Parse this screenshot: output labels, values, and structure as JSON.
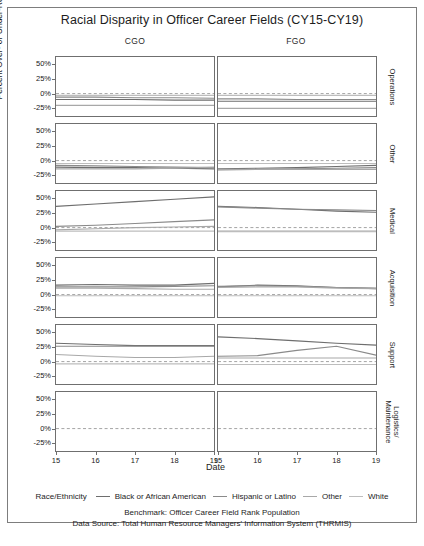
{
  "title": "Racial Disparity in Officer Career Fields (CY15-CY19)",
  "columns": [
    {
      "key": "CGO",
      "label": "CGO"
    },
    {
      "key": "FGO",
      "label": "FGO"
    }
  ],
  "rows": [
    {
      "key": "operations",
      "label": "Operations"
    },
    {
      "key": "other",
      "label": "Other"
    },
    {
      "key": "medical",
      "label": "Medical"
    },
    {
      "key": "acquisition",
      "label": "Acquisition"
    },
    {
      "key": "support",
      "label": "Support"
    },
    {
      "key": "logistics",
      "label": "Logistics/\nMaintenance"
    }
  ],
  "axes": {
    "ylabel": "Percent Over- or Under-Representation",
    "xlabel": "Date",
    "yticks": [
      "50%",
      "25%",
      "0%",
      "-25%"
    ],
    "ytick_values": [
      50,
      25,
      0,
      -25
    ],
    "xticks": [
      "15",
      "16",
      "17",
      "18",
      "19"
    ],
    "xtick_values": [
      15,
      16,
      17,
      18,
      19
    ],
    "ylim": [
      -38,
      62
    ],
    "xlim": [
      15,
      19
    ],
    "zero_line": 0,
    "grid": "none"
  },
  "legend": {
    "title": "Race/Ethnicity",
    "position": "bottom",
    "entries": [
      {
        "label": "Black or African American",
        "color": "#6e6e6e"
      },
      {
        "label": "Hispanic or Latino",
        "color": "#8a8a8a"
      },
      {
        "label": "Other",
        "color": "#a8a8a8"
      },
      {
        "label": "White",
        "color": "#bdbdbd"
      }
    ]
  },
  "captions": {
    "benchmark": "Benchmark: Officer Career Field Rank Population",
    "source": "Data Source: Total Human Resource Managers' Information System (THRMIS)"
  },
  "chart_data": {
    "type": "line",
    "title": "Racial Disparity in Officer Career Fields (CY15-CY19)",
    "xlabel": "Date",
    "ylabel": "Percent Over- or Under-Representation",
    "x": [
      15,
      16,
      17,
      18,
      19
    ],
    "xlim": [
      15,
      19
    ],
    "ylim": [
      -38,
      62
    ],
    "yticks": [
      50,
      25,
      0,
      -25
    ],
    "grid": false,
    "legend_position": "bottom",
    "facet_rows": [
      "Operations",
      "Other",
      "Medical",
      "Acquisition",
      "Support",
      "Logistics/Maintenance"
    ],
    "facet_cols": [
      "CGO",
      "FGO"
    ],
    "units": "percent",
    "reference_line": {
      "value": 0,
      "style": "dashed"
    },
    "panels": [
      {
        "row": "Operations",
        "col": "CGO",
        "series": [
          {
            "name": "Black or African American",
            "color": "#6e6e6e",
            "values": [
              -10,
              -10,
              -10,
              -11,
              -11
            ]
          },
          {
            "name": "Hispanic or Latino",
            "color": "#8a8a8a",
            "values": [
              -6,
              -6,
              -7,
              -7,
              -8
            ]
          },
          {
            "name": "Other",
            "color": "#a8a8a8",
            "values": [
              -20,
              -20,
              -20,
              -20,
              -20
            ]
          },
          {
            "name": "White",
            "color": "#bdbdbd",
            "values": [
              -3,
              -3,
              -3,
              -3,
              -3
            ]
          }
        ]
      },
      {
        "row": "Operations",
        "col": "FGO",
        "series": [
          {
            "name": "Black or African American",
            "color": "#6e6e6e",
            "values": [
              -13,
              -13,
              -13,
              -13,
              -13
            ]
          },
          {
            "name": "Hispanic or Latino",
            "color": "#8a8a8a",
            "values": [
              -9,
              -9,
              -10,
              -10,
              -10
            ]
          },
          {
            "name": "Other",
            "color": "#a8a8a8",
            "values": [
              -25,
              -25,
              -25,
              -25,
              -25
            ]
          },
          {
            "name": "White",
            "color": "#bdbdbd",
            "values": [
              -3,
              -3,
              -3,
              -3,
              -3
            ]
          }
        ]
      },
      {
        "row": "Other",
        "col": "CGO",
        "series": [
          {
            "name": "Black or African American",
            "color": "#6e6e6e",
            "values": [
              -11,
              -12,
              -12,
              -13,
              -14
            ]
          },
          {
            "name": "Hispanic or Latino",
            "color": "#8a8a8a",
            "values": [
              -8,
              -9,
              -10,
              -11,
              -12
            ]
          },
          {
            "name": "Other",
            "color": "#a8a8a8",
            "values": [
              -14,
              -14,
              -14,
              -13,
              -11
            ]
          },
          {
            "name": "White",
            "color": "#bdbdbd",
            "values": [
              -5,
              -5,
              -5,
              -5,
              -5
            ]
          }
        ]
      },
      {
        "row": "Other",
        "col": "FGO",
        "series": [
          {
            "name": "Black or African American",
            "color": "#6e6e6e",
            "values": [
              -14,
              -13,
              -12,
              -10,
              -8
            ]
          },
          {
            "name": "Hispanic or Latino",
            "color": "#8a8a8a",
            "values": [
              -16,
              -15,
              -14,
              -13,
              -12
            ]
          },
          {
            "name": "Other",
            "color": "#a8a8a8",
            "values": [
              -15,
              -15,
              -15,
              -15,
              -15
            ]
          },
          {
            "name": "White",
            "color": "#bdbdbd",
            "values": [
              -5,
              -5,
              -5,
              -5,
              -5
            ]
          }
        ]
      },
      {
        "row": "Medical",
        "col": "CGO",
        "series": [
          {
            "name": "Black or African American",
            "color": "#6e6e6e",
            "values": [
              36,
              40,
              44,
              48,
              52
            ]
          },
          {
            "name": "Hispanic or Latino",
            "color": "#8a8a8a",
            "values": [
              2,
              4,
              7,
              10,
              13
            ]
          },
          {
            "name": "Other",
            "color": "#a8a8a8",
            "values": [
              -4,
              -2,
              0,
              1,
              2
            ]
          },
          {
            "name": "White",
            "color": "#bdbdbd",
            "values": [
              -6,
              -6,
              -6,
              -6,
              -6
            ]
          }
        ]
      },
      {
        "row": "Medical",
        "col": "FGO",
        "series": [
          {
            "name": "Black or African American",
            "color": "#6e6e6e",
            "values": [
              36,
              34,
              31,
              28,
              26
            ]
          },
          {
            "name": "Hispanic or Latino",
            "color": "#8a8a8a",
            "values": [
              35,
              33,
              31,
              30,
              29
            ]
          },
          {
            "name": "Other",
            "color": "#a8a8a8",
            "values": [
              -6,
              -6,
              -6,
              -6,
              -6
            ]
          },
          {
            "name": "White",
            "color": "#bdbdbd",
            "values": [
              -7,
              -7,
              -7,
              -7,
              -7
            ]
          }
        ]
      },
      {
        "row": "Acquisition",
        "col": "CGO",
        "series": [
          {
            "name": "Black or African American",
            "color": "#6e6e6e",
            "values": [
              16,
              17,
              16,
              16,
              19
            ]
          },
          {
            "name": "Hispanic or Latino",
            "color": "#8a8a8a",
            "values": [
              13,
              13,
              13,
              14,
              15
            ]
          },
          {
            "name": "Other",
            "color": "#a8a8a8",
            "values": [
              11,
              11,
              10,
              9,
              9
            ]
          },
          {
            "name": "White",
            "color": "#bdbdbd",
            "values": [
              -2,
              -2,
              -2,
              -2,
              -2
            ]
          }
        ]
      },
      {
        "row": "Acquisition",
        "col": "FGO",
        "series": [
          {
            "name": "Black or African American",
            "color": "#6e6e6e",
            "values": [
              13,
              16,
              15,
              12,
              10
            ]
          },
          {
            "name": "Hispanic or Latino",
            "color": "#8a8a8a",
            "values": [
              14,
              15,
              14,
              12,
              11
            ]
          },
          {
            "name": "Other",
            "color": "#a8a8a8",
            "values": [
              12,
              13,
              13,
              11,
              10
            ]
          },
          {
            "name": "White",
            "color": "#bdbdbd",
            "values": [
              -2,
              -2,
              -2,
              -2,
              -2
            ]
          }
        ]
      },
      {
        "row": "Support",
        "col": "CGO",
        "series": [
          {
            "name": "Black or African American",
            "color": "#6e6e6e",
            "values": [
              31,
              29,
              27,
              27,
              27
            ]
          },
          {
            "name": "Hispanic or Latino",
            "color": "#8a8a8a",
            "values": [
              26,
              26,
              26,
              26,
              26
            ]
          },
          {
            "name": "Other",
            "color": "#a8a8a8",
            "values": [
              12,
              9,
              7,
              7,
              9
            ]
          },
          {
            "name": "White",
            "color": "#bdbdbd",
            "values": [
              -4,
              -4,
              -4,
              -4,
              -4
            ]
          }
        ]
      },
      {
        "row": "Support",
        "col": "FGO",
        "series": [
          {
            "name": "Black or African American",
            "color": "#6e6e6e",
            "values": [
              42,
              39,
              35,
              31,
              28
            ]
          },
          {
            "name": "Hispanic or Latino",
            "color": "#8a8a8a",
            "values": [
              9,
              10,
              19,
              26,
              11
            ]
          },
          {
            "name": "Other",
            "color": "#a8a8a8",
            "values": [
              6,
              6,
              6,
              6,
              6
            ]
          },
          {
            "name": "White",
            "color": "#bdbdbd",
            "values": [
              -5,
              -5,
              -5,
              -5,
              -5
            ]
          }
        ]
      },
      {
        "row": "Logistics/Maintenance",
        "col": "CGO",
        "series": [
          {
            "name": "Black or African American",
            "color": "#6e6e6e",
            "values": [
              30,
              33,
              32,
              27,
              25
            ]
          },
          {
            "name": "Hispanic or Latino",
            "color": "#8a8a8a",
            "values": [
              30,
              32,
              30,
              27,
              31
            ]
          },
          {
            "name": "Other",
            "color": "#a8a8a8",
            "values": [
              29,
              31,
              29,
              26,
              20
            ]
          },
          {
            "name": "White",
            "color": "#bdbdbd",
            "values": [
              -7,
              -7,
              -7,
              -7,
              -7
            ]
          }
        ]
      },
      {
        "row": "Logistics/Maintenance",
        "col": "FGO",
        "series": [
          {
            "name": "Black or African American",
            "color": "#6e6e6e",
            "values": [
              36,
              42,
              44,
              41,
              31
            ]
          },
          {
            "name": "Hispanic or Latino",
            "color": "#8a8a8a",
            "values": [
              34,
              30,
              26,
              22,
              28
            ]
          },
          {
            "name": "Other",
            "color": "#a8a8a8",
            "values": [
              -11,
              -13,
              -16,
              -14,
              -7
            ]
          },
          {
            "name": "White",
            "color": "#bdbdbd",
            "values": [
              -7,
              -7,
              -7,
              -7,
              -7
            ]
          }
        ]
      }
    ]
  }
}
